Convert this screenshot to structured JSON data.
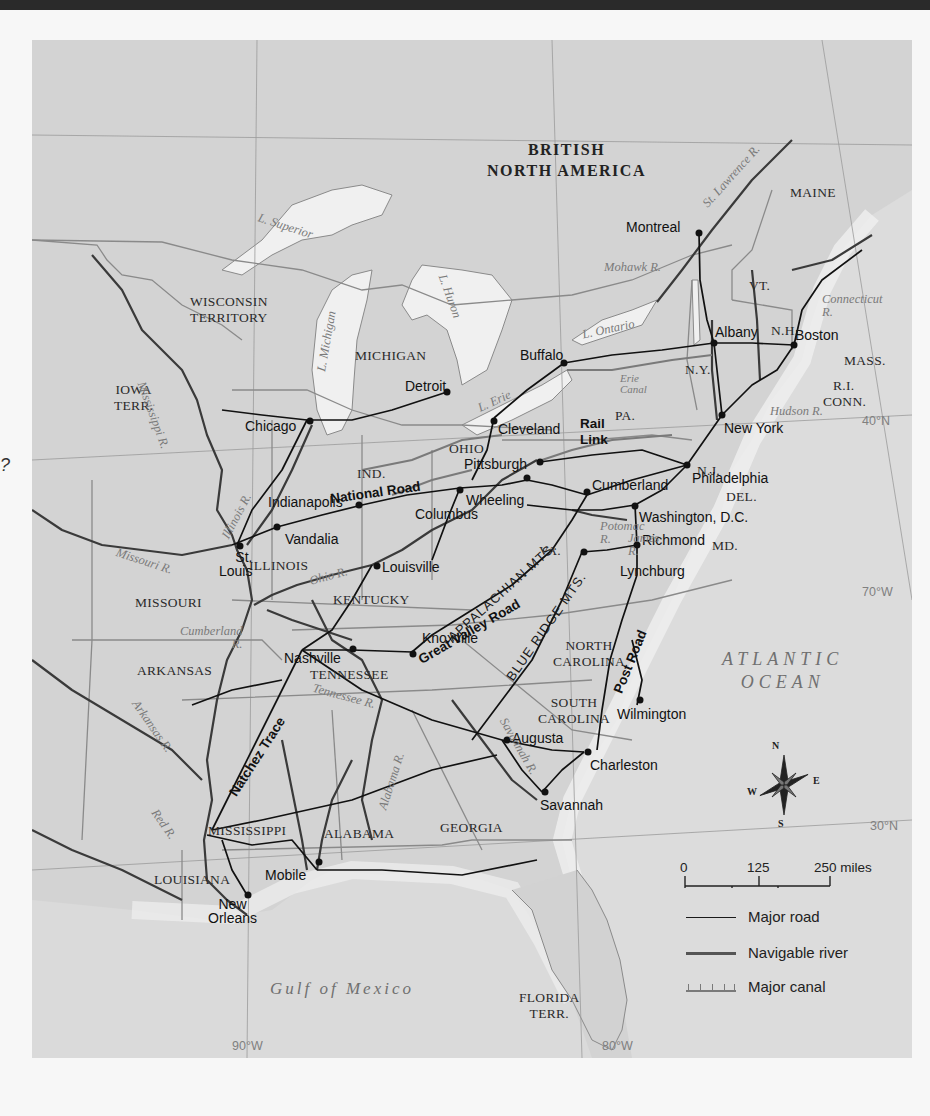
{
  "page": {
    "margin_mark": "?"
  },
  "map": {
    "regions": {
      "british_north_america": "BRITISH\nNORTH AMERICA",
      "atlantic_ocean": "ATLANTIC\nOCEAN",
      "gulf_of_mexico": "Gulf of Mexico"
    },
    "states": [
      {
        "id": "maine",
        "label": "MAINE"
      },
      {
        "id": "vt",
        "label": "VT."
      },
      {
        "id": "nh",
        "label": "N.H."
      },
      {
        "id": "mass",
        "label": "MASS."
      },
      {
        "id": "ri",
        "label": "R.I."
      },
      {
        "id": "conn",
        "label": "CONN."
      },
      {
        "id": "ny",
        "label": "N.Y."
      },
      {
        "id": "pa",
        "label": "PA."
      },
      {
        "id": "nj",
        "label": "N.J."
      },
      {
        "id": "del",
        "label": "DEL."
      },
      {
        "id": "md",
        "label": "MD."
      },
      {
        "id": "va",
        "label": "VA."
      },
      {
        "id": "ohio",
        "label": "OHIO"
      },
      {
        "id": "ind",
        "label": "IND."
      },
      {
        "id": "illinois",
        "label": "ILLINOIS"
      },
      {
        "id": "michigan",
        "label": "MICHIGAN"
      },
      {
        "id": "wisconsin",
        "label": "WISCONSIN\nTERRITORY"
      },
      {
        "id": "iowa",
        "label": "IOWA\nTERR."
      },
      {
        "id": "missouri",
        "label": "MISSOURI"
      },
      {
        "id": "kentucky",
        "label": "KENTUCKY"
      },
      {
        "id": "tennessee",
        "label": "TENNESSEE"
      },
      {
        "id": "north_carolina",
        "label": "NORTH\nCAROLINA"
      },
      {
        "id": "south_carolina",
        "label": "SOUTH\nCAROLINA"
      },
      {
        "id": "georgia",
        "label": "GEORGIA"
      },
      {
        "id": "alabama",
        "label": "ALABAMA"
      },
      {
        "id": "mississippi",
        "label": "MISSISSIPPI"
      },
      {
        "id": "louisiana",
        "label": "LOUISIANA"
      },
      {
        "id": "arkansas",
        "label": "ARKANSAS"
      },
      {
        "id": "florida",
        "label": "FLORIDA\nTERR."
      }
    ],
    "cities": [
      {
        "id": "montreal",
        "label": "Montreal"
      },
      {
        "id": "albany",
        "label": "Albany"
      },
      {
        "id": "boston",
        "label": "Boston"
      },
      {
        "id": "buffalo",
        "label": "Buffalo"
      },
      {
        "id": "new_york",
        "label": "New York"
      },
      {
        "id": "detroit",
        "label": "Detroit"
      },
      {
        "id": "cleveland",
        "label": "Cleveland"
      },
      {
        "id": "chicago",
        "label": "Chicago"
      },
      {
        "id": "pittsburgh",
        "label": "Pittsburgh"
      },
      {
        "id": "philadelphia",
        "label": "Philadelphia"
      },
      {
        "id": "cumberland",
        "label": "Cumberland"
      },
      {
        "id": "wheeling",
        "label": "Wheeling"
      },
      {
        "id": "columbus",
        "label": "Columbus"
      },
      {
        "id": "indianapolis",
        "label": "Indianapolis"
      },
      {
        "id": "vandalia",
        "label": "Vandalia"
      },
      {
        "id": "st_louis",
        "label": "St.\nLouis"
      },
      {
        "id": "washington",
        "label": "Washington, D.C."
      },
      {
        "id": "louisville",
        "label": "Louisville"
      },
      {
        "id": "richmond",
        "label": "Richmond"
      },
      {
        "id": "lynchburg",
        "label": "Lynchburg"
      },
      {
        "id": "knoxville",
        "label": "Knoxville"
      },
      {
        "id": "nashville",
        "label": "Nashville"
      },
      {
        "id": "wilmington",
        "label": "Wilmington"
      },
      {
        "id": "augusta",
        "label": "Augusta"
      },
      {
        "id": "charleston",
        "label": "Charleston"
      },
      {
        "id": "savannah",
        "label": "Savannah"
      },
      {
        "id": "mobile",
        "label": "Mobile"
      },
      {
        "id": "new_orleans",
        "label": "New\nOrleans"
      }
    ],
    "waters": [
      {
        "id": "l_superior",
        "label": "L. Superior"
      },
      {
        "id": "l_michigan",
        "label": "L. Michigan"
      },
      {
        "id": "l_huron",
        "label": "L. Huron"
      },
      {
        "id": "l_erie",
        "label": "L. Erie"
      },
      {
        "id": "l_ontario",
        "label": "L. Ontario"
      },
      {
        "id": "st_lawrence",
        "label": "St. Lawrence R."
      },
      {
        "id": "mohawk",
        "label": "Mohawk R."
      },
      {
        "id": "connecticut",
        "label": "Connecticut\nR."
      },
      {
        "id": "hudson",
        "label": "Hudson R."
      },
      {
        "id": "erie_canal",
        "label": "Erie\nCanal"
      },
      {
        "id": "mississippi_r",
        "label": "Mississippi R."
      },
      {
        "id": "illinois_r",
        "label": "Illinois R."
      },
      {
        "id": "missouri_r",
        "label": "Missouri R."
      },
      {
        "id": "ohio_r",
        "label": "Ohio R."
      },
      {
        "id": "cumberland_r",
        "label": "Cumberland\nR."
      },
      {
        "id": "tennessee_r",
        "label": "Tennessee R."
      },
      {
        "id": "arkansas_r",
        "label": "Arkansas R."
      },
      {
        "id": "red_r",
        "label": "Red R."
      },
      {
        "id": "alabama_r",
        "label": "Alabama R."
      },
      {
        "id": "savannah_r",
        "label": "Savannah R."
      },
      {
        "id": "potomac_r",
        "label": "Potomac\nR."
      },
      {
        "id": "james_r",
        "label": "James\nR."
      }
    ],
    "routes": [
      {
        "id": "national_road",
        "label": "National Road"
      },
      {
        "id": "rail_link",
        "label": "Rail\nLink"
      },
      {
        "id": "great_valley_road",
        "label": "Great Valley Road"
      },
      {
        "id": "natchez_trace",
        "label": "Natchez Trace"
      },
      {
        "id": "post_road",
        "label": "Post Road"
      }
    ],
    "mountains": [
      {
        "id": "appalachian",
        "label": "APPALACHIAN MTS."
      },
      {
        "id": "blue_ridge",
        "label": "BLUE RIDGE MTS."
      }
    ],
    "coordinates": {
      "lat_40": "40°N",
      "lat_30": "30°N",
      "lon_70": "70°W",
      "lon_80": "80°W",
      "lon_90": "90°W"
    },
    "compass": {
      "n": "N",
      "s": "S",
      "e": "E",
      "w": "W"
    },
    "scale": {
      "miles_ticks": [
        "0",
        "125",
        "250 miles"
      ],
      "km_ticks": [
        "0",
        "125",
        "250 kilometers"
      ]
    },
    "legend": {
      "items": [
        {
          "id": "major_road",
          "label": "Major road",
          "color": "#1a1a1a"
        },
        {
          "id": "navigable_river",
          "label": "Navigable river",
          "color": "#555555"
        },
        {
          "id": "major_canal",
          "label": "Major canal",
          "color": "#7a7a7a"
        }
      ]
    },
    "colors": {
      "land": "#d2d2d2",
      "water": "#ececec",
      "road": "#1a1a1a",
      "river": "#4a4a4a",
      "border": "#8a8a8a"
    }
  }
}
